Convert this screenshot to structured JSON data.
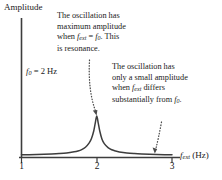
{
  "figure": {
    "background_color": "#ffffff",
    "ink_color": "#1a1a1a",
    "curve_color": "#3d3d3d"
  },
  "axes": {
    "y_title": "Amplitude",
    "x_title_main": "f",
    "x_title_sub": "ext",
    "x_title_units": "(Hz)",
    "x_ticks": [
      {
        "label": "1",
        "value": 1
      },
      {
        "label": "2",
        "value": 2
      },
      {
        "label": "3",
        "value": 3
      }
    ],
    "x_range": [
      1,
      3
    ],
    "y_range": [
      0,
      1
    ]
  },
  "labels": {
    "f0_prefix": "f",
    "f0_sub": "0",
    "f0_value": " = 2 Hz"
  },
  "annotations": {
    "resonance": {
      "line1": "The oscillation has",
      "line2": "maximum amplitude",
      "line3_a": "when ",
      "line3_f": "f",
      "line3_fsub": "ext",
      "line3_eq": " = ",
      "line3_f0": "f",
      "line3_f0sub": "0",
      "line3_b": ". This",
      "line4": "is resonance."
    },
    "off_resonance": {
      "line1": "The oscillation has",
      "line2": "only a small amplitude",
      "line3_a": "when ",
      "line3_f": "f",
      "line3_fsub": "ext",
      "line3_b": " differs",
      "line4_a": "substantially from ",
      "line4_f": "f",
      "line4_fsub": "0",
      "line4_b": "."
    }
  },
  "chart_data": {
    "type": "line",
    "title": "",
    "xlabel": "f_ext (Hz)",
    "ylabel": "Amplitude",
    "xlim": [
      1,
      3
    ],
    "ylim": [
      0,
      1
    ],
    "grid": false,
    "legend": null,
    "resonance_frequency_hz": 2,
    "peak_amplitude_normalized": 1.0,
    "series": [
      {
        "name": "amplitude",
        "x": [
          1.0,
          1.1,
          1.2,
          1.3,
          1.4,
          1.5,
          1.6,
          1.7,
          1.75,
          1.8,
          1.85,
          1.9,
          1.93,
          1.96,
          1.98,
          2.0,
          2.02,
          2.04,
          2.07,
          2.1,
          2.15,
          2.2,
          2.25,
          2.3,
          2.4,
          2.5,
          2.6,
          2.7,
          2.8,
          2.9,
          3.0
        ],
        "y": [
          0.02,
          0.022,
          0.026,
          0.031,
          0.038,
          0.048,
          0.064,
          0.093,
          0.115,
          0.15,
          0.21,
          0.32,
          0.43,
          0.62,
          0.82,
          1.0,
          0.82,
          0.62,
          0.41,
          0.3,
          0.2,
          0.145,
          0.112,
          0.09,
          0.063,
          0.048,
          0.038,
          0.031,
          0.026,
          0.022,
          0.02
        ]
      }
    ]
  }
}
